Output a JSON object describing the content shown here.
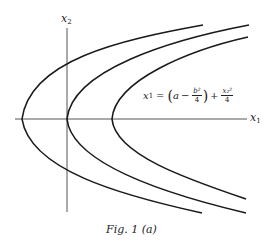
{
  "figure": {
    "caption": "Fig. 1 (a)",
    "axes": {
      "x_label": "x",
      "x_sub": "1",
      "y_label": "x",
      "y_sub": "2"
    },
    "equation": {
      "lhs": "x",
      "lhs_sub": "1",
      "equals": "=",
      "open": "(",
      "a": "a",
      "minus": "−",
      "frac1_num": "b²",
      "frac1_den": "4",
      "close": ")",
      "plus": "+",
      "frac2_num": "x₂²",
      "frac2_den": "4"
    },
    "colors": {
      "curve": "#1a1a1a",
      "axis": "#555555",
      "background": "#ffffff"
    },
    "curves": [
      {
        "name": "parabola-left",
        "vertex": [
          22,
          119
        ],
        "top_end": [
          203,
          25
        ],
        "bottom_end": [
          202,
          213
        ]
      },
      {
        "name": "parabola-middle",
        "vertex": [
          67,
          119
        ],
        "top_end": [
          249,
          25
        ],
        "bottom_end": [
          246,
          213
        ]
      },
      {
        "name": "parabola-right",
        "vertex": [
          112,
          119
        ],
        "top_end": [
          248,
          37
        ],
        "bottom_end": [
          246,
          199
        ]
      }
    ]
  }
}
